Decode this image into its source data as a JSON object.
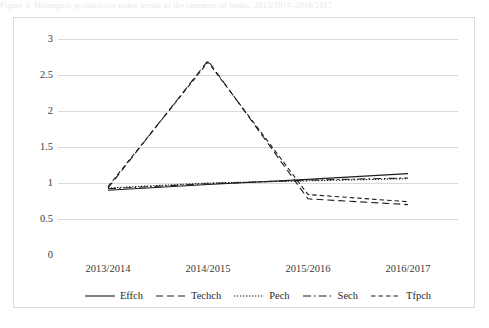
{
  "top_clip_text": "Figure 4. Malmquist productivity index trends of the commercial banks, 2013/2014–2016/2017",
  "chart_data": {
    "type": "line",
    "title": "",
    "xlabel": "",
    "ylabel": "",
    "categories": [
      "2013/2014",
      "2014/2015",
      "2015/2016",
      "2016/2017"
    ],
    "ylim": [
      0,
      3
    ],
    "yticks": [
      "0",
      "0.5",
      "1",
      "1.5",
      "2",
      "2.5",
      "3"
    ],
    "ytick_values": [
      0,
      0.5,
      1,
      1.5,
      2,
      2.5,
      3
    ],
    "grid": "horizontal",
    "legend_position": "bottom",
    "series": [
      {
        "name": "Effch",
        "style": "solid",
        "values": [
          0.9,
          0.98,
          1.05,
          1.13
        ]
      },
      {
        "name": "Techch",
        "style": "dashed",
        "values": [
          0.93,
          2.7,
          0.78,
          0.7
        ]
      },
      {
        "name": "Pech",
        "style": "dotted",
        "values": [
          0.93,
          1.0,
          1.03,
          1.06
        ]
      },
      {
        "name": "Sech",
        "style": "dash-dot",
        "values": [
          0.92,
          0.99,
          1.04,
          1.07
        ]
      },
      {
        "name": "Tfpch",
        "style": "fine-dashed",
        "values": [
          0.95,
          2.68,
          0.84,
          0.74
        ]
      }
    ]
  },
  "legend": {
    "items": [
      {
        "label": "Effch",
        "swatch": "solid-line-swatch"
      },
      {
        "label": "Techch",
        "swatch": "dashed-line-swatch"
      },
      {
        "label": "Pech",
        "swatch": "dotted-line-swatch"
      },
      {
        "label": "Sech",
        "swatch": "dash-dot-line-swatch"
      },
      {
        "label": "Tfpch",
        "swatch": "fine-dashed-line-swatch"
      }
    ]
  }
}
